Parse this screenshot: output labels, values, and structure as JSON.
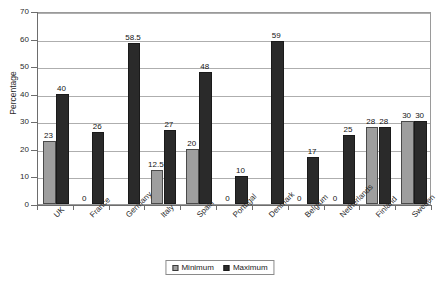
{
  "chart_data": {
    "type": "bar",
    "title": "",
    "xlabel": "",
    "ylabel": "Percentage",
    "ylim": [
      0,
      70
    ],
    "ytick_step": 10,
    "yticks": [
      "0",
      "10",
      "20",
      "30",
      "40",
      "50",
      "60",
      "70"
    ],
    "grid": true,
    "legend_position": "bottom-center",
    "categories": [
      "UK",
      "France",
      "Germany",
      "Italy",
      "Spain",
      "Portugal",
      "Denmark",
      "Belgium",
      "Netherlands",
      "Finland",
      "Sweden"
    ],
    "series": [
      {
        "name": "Minimum",
        "color": "#9e9e9e",
        "values": [
          23,
          0,
          null,
          12.5,
          20,
          0,
          null,
          0,
          0,
          28,
          30
        ],
        "labels": [
          "23",
          "0",
          "",
          "12.5",
          "20",
          "0",
          "",
          "0",
          "0",
          "28",
          "30"
        ]
      },
      {
        "name": "Maximum",
        "color": "#2a2a2a",
        "values": [
          40,
          26,
          58.5,
          27,
          48,
          10,
          59,
          17,
          25,
          28,
          30
        ],
        "labels": [
          "40",
          "26",
          "58.5",
          "27",
          "48",
          "10",
          "59",
          "17",
          "25",
          "28",
          "30"
        ]
      }
    ]
  },
  "legend": {
    "entries": [
      {
        "label": "Minimum"
      },
      {
        "label": "Maximum"
      }
    ]
  },
  "axes": {
    "y_title": "Percentage"
  }
}
